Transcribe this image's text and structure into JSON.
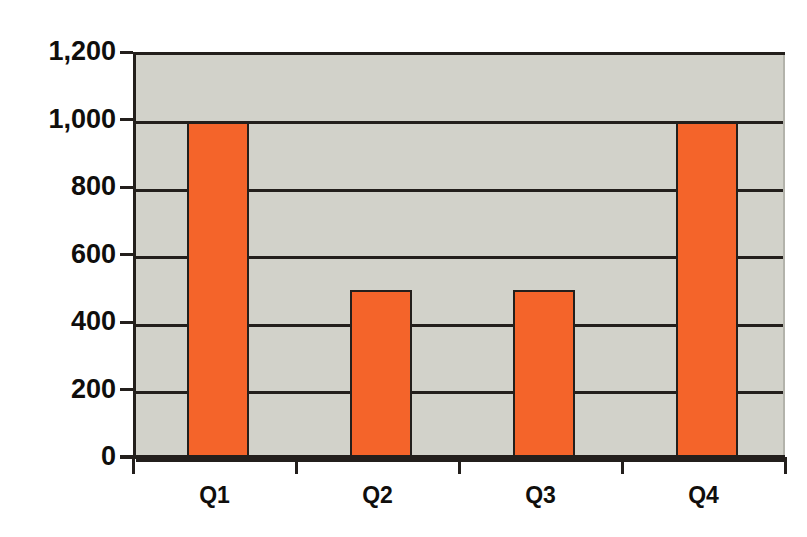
{
  "chart_data": {
    "type": "bar",
    "title": "",
    "title_note": "title cropped off at top edge of image",
    "xlabel": "",
    "ylabel": "",
    "categories": [
      "Q1",
      "Q2",
      "Q3",
      "Q4"
    ],
    "values": [
      1000,
      500,
      500,
      1000
    ],
    "ylim": [
      0,
      1200
    ],
    "ytick_values": [
      0,
      200,
      400,
      600,
      800,
      1000,
      1200
    ],
    "ytick_labels": [
      "0",
      "200",
      "400",
      "600",
      "800",
      "1,000",
      "1,200"
    ],
    "grid": true,
    "legend": false,
    "bar_color": "#f4642a",
    "bar_outline_color": "#231f1c",
    "plot_background_color": "#d2d2ca",
    "gridline_color": "#231f1c",
    "page_background_color": "#ffffff",
    "text_color": "#100e0c"
  },
  "axes": {
    "y": {
      "ticks": [
        {
          "label": "1,200",
          "value": 1200
        },
        {
          "label": "1,000",
          "value": 1000
        },
        {
          "label": "800",
          "value": 800
        },
        {
          "label": "600",
          "value": 600
        },
        {
          "label": "400",
          "value": 400
        },
        {
          "label": "200",
          "value": 200
        },
        {
          "label": "0",
          "value": 0
        }
      ]
    },
    "x": {
      "ticks": [
        {
          "label": "Q1"
        },
        {
          "label": "Q2"
        },
        {
          "label": "Q3"
        },
        {
          "label": "Q4"
        }
      ]
    }
  }
}
